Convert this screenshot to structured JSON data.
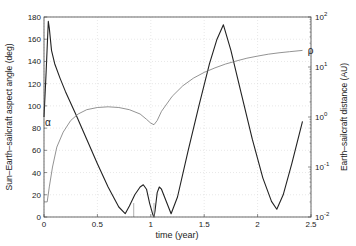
{
  "chart_data": {
    "type": "line",
    "title": "",
    "xlabel": "time  (year)",
    "ylabel": "Sun–Earth–sailcraft aspect angle (deg)",
    "ylabel_right": "Earth–sailcraft distance (AU)",
    "xlim": [
      0,
      2.5
    ],
    "ylim": [
      0,
      180
    ],
    "ylim_right": [
      0.01,
      100
    ],
    "yscale_right": "log",
    "grid": true,
    "x_ticks": [
      "0",
      "0.5",
      "1",
      "1.5",
      "2",
      "2.5"
    ],
    "y_ticks": [
      "0",
      "20",
      "40",
      "60",
      "80",
      "100",
      "120",
      "140",
      "160",
      "180"
    ],
    "y_ticks_right": [
      "10^-2",
      "10^-1",
      "10^0",
      "10^1",
      "10^2"
    ],
    "annotations": [
      {
        "text": "α",
        "x": 0.0,
        "y": 85,
        "axis": "left"
      },
      {
        "text": "ρ",
        "x": 2.45,
        "y": 21,
        "axis": "right"
      }
    ],
    "series": [
      {
        "name": "α (aspect angle)",
        "axis": "left",
        "color": "#222222",
        "x": [
          0.0,
          0.02,
          0.04,
          0.05,
          0.07,
          0.1,
          0.15,
          0.2,
          0.3,
          0.4,
          0.5,
          0.6,
          0.7,
          0.76,
          0.8,
          0.85,
          0.9,
          0.93,
          0.96,
          0.99,
          1.02,
          1.03,
          1.04,
          1.06,
          1.08,
          1.1,
          1.14,
          1.19,
          1.25,
          1.35,
          1.45,
          1.55,
          1.62,
          1.68,
          1.75,
          1.85,
          1.95,
          2.05,
          2.13,
          2.18,
          2.24,
          2.32,
          2.42
        ],
        "values": [
          90,
          130,
          176,
          170,
          150,
          138,
          125,
          113,
          92,
          70,
          48,
          27,
          9,
          3,
          10,
          20,
          27,
          29,
          25,
          12,
          2,
          0,
          6,
          22,
          27,
          25,
          15,
          3,
          18,
          60,
          100,
          138,
          160,
          173,
          150,
          110,
          70,
          35,
          14,
          7,
          20,
          48,
          86
        ]
      },
      {
        "name": "ρ (distance, AU)",
        "axis": "right",
        "color": "#777777",
        "x": [
          0.0,
          0.03,
          0.05,
          0.08,
          0.12,
          0.18,
          0.25,
          0.32,
          0.4,
          0.5,
          0.6,
          0.7,
          0.8,
          0.9,
          0.96,
          1.0,
          1.03,
          1.06,
          1.1,
          1.2,
          1.3,
          1.4,
          1.5,
          1.6,
          1.7,
          1.8,
          1.9,
          2.0,
          2.1,
          2.2,
          2.3,
          2.42
        ],
        "values": [
          0.02,
          0.02,
          0.04,
          0.1,
          0.25,
          0.5,
          0.85,
          1.15,
          1.4,
          1.55,
          1.6,
          1.55,
          1.4,
          1.15,
          0.9,
          0.75,
          0.7,
          0.85,
          1.3,
          2.6,
          4.2,
          6.0,
          7.8,
          9.6,
          11.5,
          13.2,
          15.0,
          16.5,
          18.0,
          19.2,
          20.2,
          21.5
        ]
      }
    ]
  }
}
